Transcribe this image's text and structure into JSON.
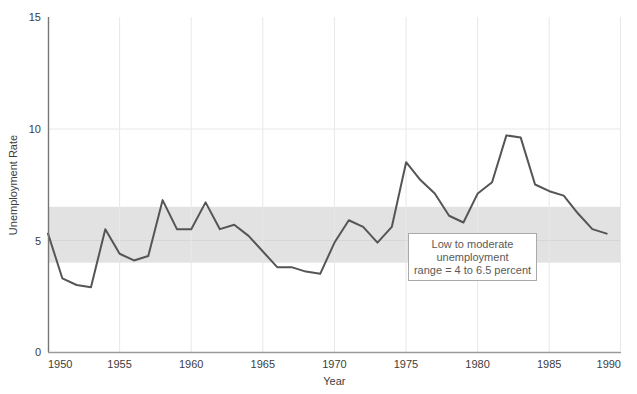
{
  "chart_data": {
    "type": "line",
    "title": "",
    "xlabel": "Year",
    "ylabel": "Unemployment Rate",
    "xlim": [
      1950,
      1990
    ],
    "ylim": [
      0,
      15
    ],
    "xticks": [
      "1950",
      "1955",
      "1960",
      "1965",
      "1970",
      "1975",
      "1980",
      "1985",
      "1990"
    ],
    "yticks": [
      "0",
      "5",
      "10",
      "15"
    ],
    "grid": true,
    "legend": "none",
    "line_color": "#555555",
    "band_color": "#e2e2e2",
    "x": [
      1950,
      1951,
      1952,
      1953,
      1954,
      1955,
      1956,
      1957,
      1958,
      1959,
      1960,
      1961,
      1962,
      1963,
      1964,
      1965,
      1966,
      1967,
      1968,
      1969,
      1970,
      1971,
      1972,
      1973,
      1974,
      1975,
      1976,
      1977,
      1978,
      1979,
      1980,
      1981,
      1982,
      1983,
      1984,
      1985,
      1986,
      1987,
      1988,
      1989
    ],
    "values": [
      5.3,
      3.3,
      3.0,
      2.9,
      5.5,
      4.4,
      4.1,
      4.3,
      6.8,
      5.5,
      5.5,
      6.7,
      5.5,
      5.7,
      5.2,
      4.5,
      3.8,
      3.8,
      3.6,
      3.5,
      4.9,
      5.9,
      5.6,
      4.9,
      5.6,
      8.5,
      7.7,
      7.1,
      6.1,
      5.8,
      7.1,
      7.6,
      9.7,
      9.6,
      7.5,
      7.2,
      7.0,
      6.2,
      5.5,
      5.3
    ],
    "shaded_band": {
      "label": "Low to moderate unemployment range",
      "y_min": 4,
      "y_max": 6.5
    },
    "annotation": {
      "line1": "Low to moderate",
      "line2": "unemployment",
      "line3": "range = 4 to 6.5 percent"
    }
  }
}
